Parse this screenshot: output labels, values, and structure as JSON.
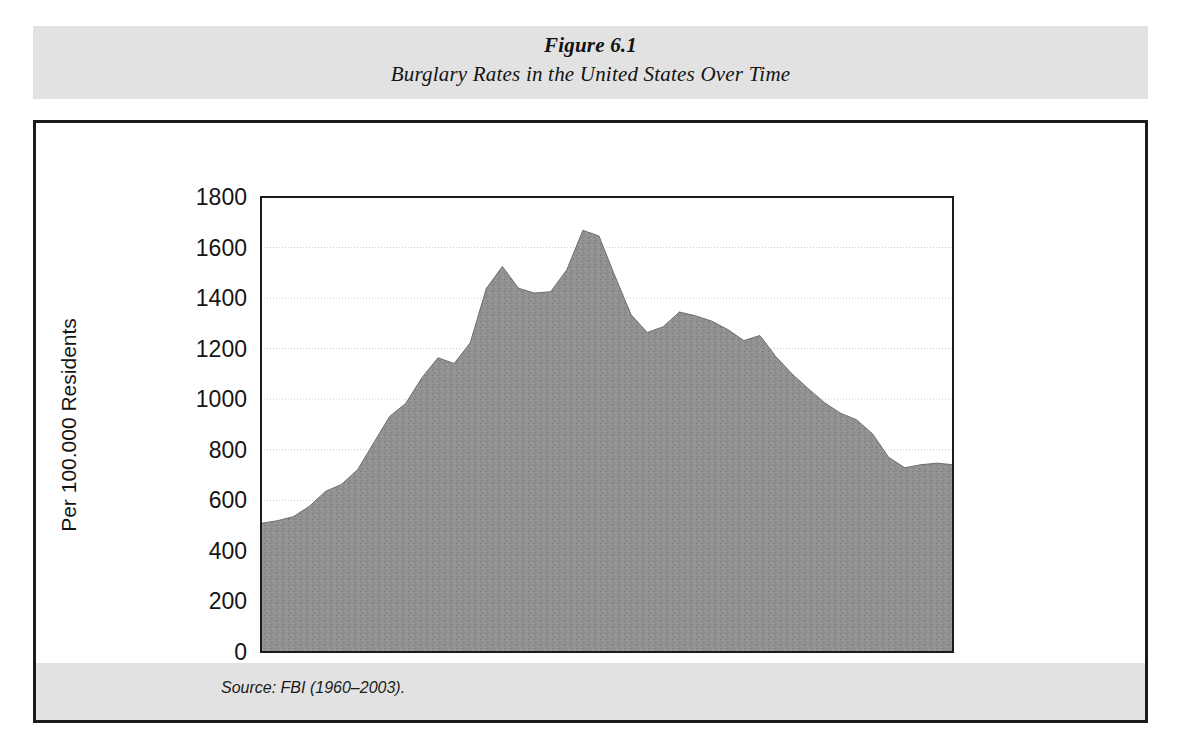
{
  "figure": {
    "number_label": "Figure 6.1",
    "title": "Burglary Rates in the United States Over Time",
    "source_note": "Source: FBI (1960–2003)."
  },
  "colors": {
    "band_background": "#e2e2e2",
    "frame_border": "#1b1b1b",
    "plot_background": "#ffffff",
    "area_fill": "#8e8e8e",
    "gridline": "#c9c9c9",
    "axis_line": "#1b1b1b",
    "text": "#151515"
  },
  "chart_data": {
    "type": "area",
    "title": "Burglary Rates in the United States Over Time",
    "xlabel": "",
    "ylabel": "Per 100.000 Residents",
    "xlim": [
      1960,
      2003
    ],
    "ylim": [
      0,
      1800
    ],
    "grid": true,
    "legend": "none",
    "x_tick_labels": [
      "1960",
      "1965",
      "1970",
      "1975",
      "1980",
      "1985",
      "1990",
      "1995",
      "2003"
    ],
    "x_tick_values": [
      1960,
      1965,
      1970,
      1975,
      1980,
      1985,
      1990,
      1995,
      2003
    ],
    "y_tick_labels": [
      "0",
      "200",
      "400",
      "600",
      "800",
      "1000",
      "1200",
      "1400",
      "1600",
      "1800"
    ],
    "y_tick_values": [
      0,
      200,
      400,
      600,
      800,
      1000,
      1200,
      1400,
      1600,
      1800
    ],
    "series": [
      {
        "name": "Burglary rate per 100,000 residents",
        "x": [
          1960,
          1961,
          1962,
          1963,
          1964,
          1965,
          1966,
          1967,
          1968,
          1969,
          1970,
          1971,
          1972,
          1973,
          1974,
          1975,
          1976,
          1977,
          1978,
          1979,
          1980,
          1981,
          1982,
          1983,
          1984,
          1985,
          1986,
          1987,
          1988,
          1989,
          1990,
          1991,
          1992,
          1993,
          1994,
          1995,
          1996,
          1997,
          1998,
          1999,
          2000,
          2001,
          2002,
          2003
        ],
        "values": [
          509,
          519,
          535,
          576,
          635,
          663,
          721,
          827,
          932,
          984,
          1085,
          1164,
          1141,
          1223,
          1438,
          1525,
          1439,
          1420,
          1425,
          1512,
          1668,
          1646,
          1486,
          1334,
          1264,
          1287,
          1345,
          1330,
          1309,
          1276,
          1232,
          1252,
          1168,
          1100,
          1042,
          987,
          945,
          919,
          863,
          770,
          729,
          741,
          747,
          741
        ]
      }
    ]
  }
}
